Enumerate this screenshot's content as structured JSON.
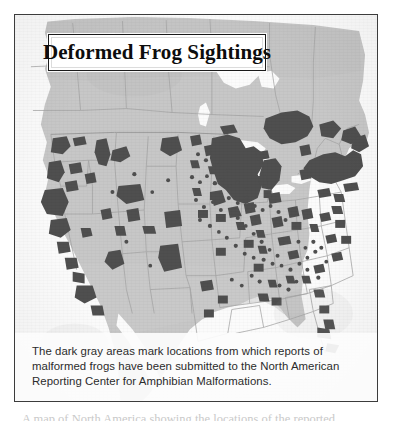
{
  "figure": {
    "title": "Deformed Frog Sightings",
    "caption": "The dark gray areas mark locations from which reports of malformed frogs have been submitted to the North American Reporting Center for Amphibian Malformations.",
    "page_text_stub": "A map of North America showing the locations of the reported"
  },
  "colors": {
    "land": "#c7c7c7",
    "land_shade": "#bfbfbf",
    "water": "#fbfbfb",
    "sighting_fill": "#4f4f4f",
    "border_line": "#a2a2a2",
    "frame": "#3c3c3c",
    "title_text": "#0d0d0d",
    "caption_text": "#2b2b2b"
  },
  "map_data": {
    "type": "choropleth-point-map",
    "projection": "north-america",
    "legend": "dark gray = reported malformed frog locations",
    "regions_with_sightings": [
      "California",
      "Oregon",
      "Washington",
      "Idaho",
      "Montana",
      "Wyoming",
      "Utah",
      "Colorado",
      "Arizona",
      "Nevada",
      "North Dakota",
      "South Dakota",
      "Nebraska",
      "Kansas",
      "Minnesota",
      "Iowa",
      "Missouri",
      "Wisconsin",
      "Illinois",
      "Indiana",
      "Michigan",
      "Ohio",
      "Kentucky",
      "Tennessee",
      "Arkansas",
      "Louisiana",
      "Mississippi",
      "Alabama",
      "Georgia",
      "Florida",
      "South Carolina",
      "North Carolina",
      "Virginia",
      "West Virginia",
      "Pennsylvania",
      "New York",
      "Vermont",
      "New Hampshire",
      "Maine",
      "Massachusetts",
      "Connecticut",
      "New Jersey",
      "Maryland",
      "Texas",
      "Oklahoma",
      "Ontario",
      "Quebec",
      "Manitoba"
    ],
    "highest_density_regions": [
      "Minnesota",
      "Wisconsin",
      "Ontario",
      "Quebec",
      "New York",
      "Vermont",
      "New Hampshire",
      "Maine",
      "Northern California",
      "Oregon"
    ]
  }
}
